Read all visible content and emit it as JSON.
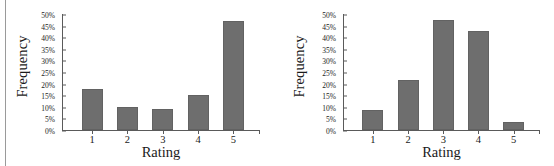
{
  "figure": {
    "divider_color": "#9a9a9a",
    "bar_color": "#6e6e6e",
    "axis_color": "#5a5a5a"
  },
  "chart_data": [
    {
      "type": "bar",
      "title": "",
      "xlabel": "Rating",
      "ylabel": "Frequency",
      "categories": [
        "1",
        "2",
        "3",
        "4",
        "5"
      ],
      "values": [
        17.5,
        10,
        9,
        15,
        47
      ],
      "ylim": [
        0,
        50
      ],
      "ytick_labels": [
        "0%",
        "5%",
        "10%",
        "15%",
        "20%",
        "25%",
        "30%",
        "35%",
        "40%",
        "45%",
        "50%"
      ],
      "ytick_values": [
        0,
        5,
        10,
        15,
        20,
        25,
        30,
        35,
        40,
        45,
        50
      ],
      "grid": false,
      "legend": "none"
    },
    {
      "type": "bar",
      "title": "",
      "xlabel": "Rating",
      "ylabel": "Frequency",
      "categories": [
        "1",
        "2",
        "3",
        "4",
        "5"
      ],
      "values": [
        8.5,
        21.5,
        47.5,
        42.5,
        3.5
      ],
      "ylim": [
        0,
        50
      ],
      "ytick_labels": [
        "0%",
        "5%",
        "10%",
        "15%",
        "20%",
        "25%",
        "30%",
        "35%",
        "40%",
        "45%",
        "50%"
      ],
      "ytick_values": [
        0,
        5,
        10,
        15,
        20,
        25,
        30,
        35,
        40,
        45,
        50
      ],
      "grid": false,
      "legend": "none"
    }
  ]
}
